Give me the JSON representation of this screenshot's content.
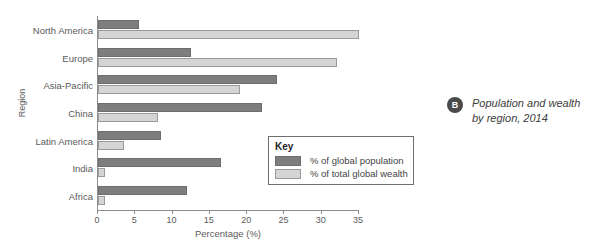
{
  "title_strip": "",
  "caption": {
    "badge": "B",
    "line1": "Population and wealth",
    "line2": "by region, 2014"
  },
  "legend": {
    "title": "Key",
    "items": [
      {
        "label": "% of global population",
        "color": "#7e7e7e"
      },
      {
        "label": "% of total global wealth",
        "color": "#d5d5d5"
      }
    ]
  },
  "chart_data": {
    "type": "bar",
    "orientation": "horizontal",
    "title": "",
    "xlabel": "Percentage (%)",
    "ylabel": "Region",
    "xlim": [
      0,
      35
    ],
    "xticks": [
      0,
      5,
      10,
      15,
      20,
      25,
      30,
      35
    ],
    "grid": false,
    "legend_position": "inside-lower-right",
    "categories": [
      "North America",
      "Europe",
      "Asia-Pacific",
      "China",
      "Latin America",
      "India",
      "Africa"
    ],
    "series": [
      {
        "name": "% of global population",
        "color": "#7e7e7e",
        "values": [
          5.5,
          12.5,
          24,
          22,
          8.5,
          16.5,
          12
        ]
      },
      {
        "name": "% of total global wealth",
        "color": "#d5d5d5",
        "values": [
          35,
          32,
          19,
          8,
          3.5,
          1,
          1
        ]
      }
    ]
  }
}
